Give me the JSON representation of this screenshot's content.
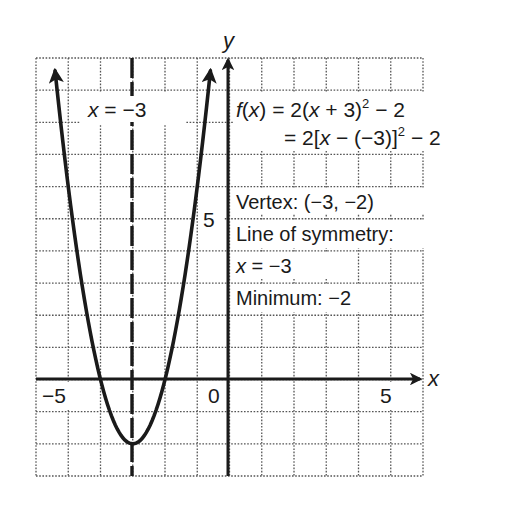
{
  "chart_data": {
    "type": "line",
    "title": "",
    "function": "f(x) = 2(x + 3)^2 - 2",
    "xlabel": "x",
    "ylabel": "y",
    "xlim": [
      -6,
      6
    ],
    "ylim": [
      -3,
      10
    ],
    "grid": true,
    "grid_style": "dotted",
    "x_tick_labels": [
      {
        "value": -5,
        "label": "−5"
      },
      {
        "value": 0,
        "label": "0"
      },
      {
        "value": 5,
        "label": "5"
      }
    ],
    "y_tick_labels": [
      {
        "value": 5,
        "label": "5"
      }
    ],
    "series": [
      {
        "name": "f(x) = 2(x + 3)^2 - 2",
        "style": "solid, arrows at both ends",
        "x": [
          -5.2,
          -5,
          -4.5,
          -4,
          -3.5,
          -3,
          -2.5,
          -2,
          -1.5,
          -1,
          -0.8
        ],
        "y": [
          7.68,
          6,
          2.5,
          0,
          -1.5,
          -2,
          -1.5,
          0,
          2.5,
          6,
          7.68
        ]
      }
    ],
    "reference_lines": [
      {
        "type": "vertical",
        "x": -3,
        "style": "dashed",
        "label": "x = −3"
      }
    ],
    "key_points": {
      "vertex": [
        -3,
        -2
      ],
      "x_intercepts": [
        -4,
        -2
      ]
    },
    "annotations": {
      "axis_line_label": "x = −3",
      "equation_line1": "f(x) = 2(x + 3)² − 2",
      "equation_line2": "= 2[x − (−3)]² − 2",
      "vertex": "Vertex: (−3, −2)",
      "symmetry_label": "Line of symmetry:",
      "symmetry_value": "x = −3",
      "minimum": "Minimum: −2"
    }
  },
  "labels": {
    "x_axis": "x",
    "y_axis": "y",
    "tick_neg5": "−5",
    "tick_0": "0",
    "tick_pos5_x": "5",
    "tick_pos5_y": "5",
    "sym_x": "x",
    "sym_rest": " = −3",
    "eq1_f": "f",
    "eq1_paren_open": "(",
    "eq1_x": "x",
    "eq1_rest": ") = 2(",
    "eq1_x2": "x",
    "eq1_tail": " + 3)",
    "eq1_sup": "2",
    "eq1_end": " − 2",
    "eq2_head": "= 2[",
    "eq2_x": "x",
    "eq2_mid": " − (−3)]",
    "eq2_sup": "2",
    "eq2_end": " − 2",
    "vertex": "Vertex: (−3, −2)",
    "symmetry": "Line of symmetry:",
    "sym2_x": "x",
    "sym2_rest": " = −3",
    "minimum": "Minimum: −2"
  }
}
